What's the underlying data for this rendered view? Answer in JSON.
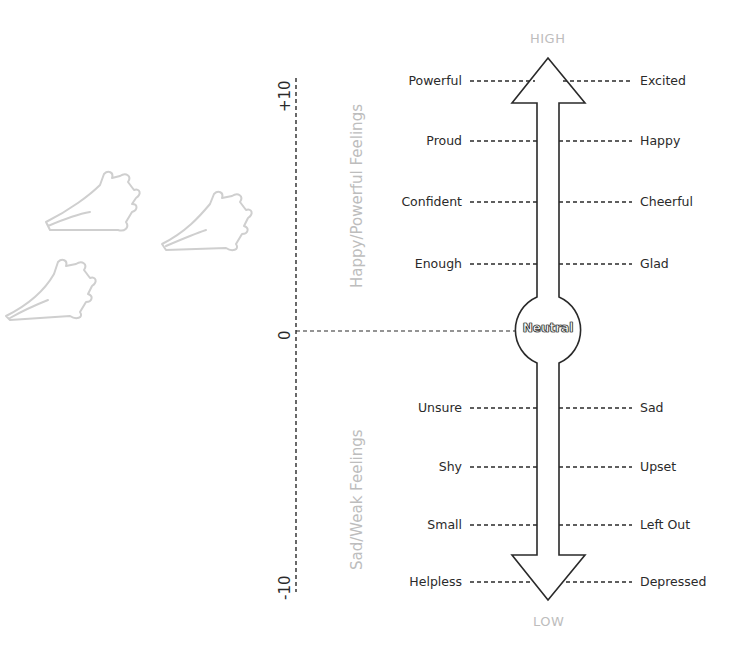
{
  "scale": {
    "top_label": "HIGH",
    "bottom_label": "LOW",
    "center_label": "Neutral",
    "axis_max": "+10",
    "axis_zero": "0",
    "axis_min": "-10",
    "upper_region": "Happy/Powerful Feelings",
    "lower_region": "Sad/Weak Feelings"
  },
  "rows": [
    {
      "left": "Powerful",
      "right": "Excited"
    },
    {
      "left": "Proud",
      "right": "Happy"
    },
    {
      "left": "Confident",
      "right": "Cheerful"
    },
    {
      "left": "Enough",
      "right": "Glad"
    },
    {
      "left": "Unsure",
      "right": "Sad"
    },
    {
      "left": "Shy",
      "right": "Upset"
    },
    {
      "left": "Small",
      "right": "Left Out"
    },
    {
      "left": "Helpless",
      "right": "Depressed"
    }
  ],
  "decoration": {
    "footprints": "paw-print-icon x3"
  },
  "colors": {
    "line": "#2a2a2a",
    "muted": "#bdbdbd",
    "footprint": "#cfcfcf"
  }
}
